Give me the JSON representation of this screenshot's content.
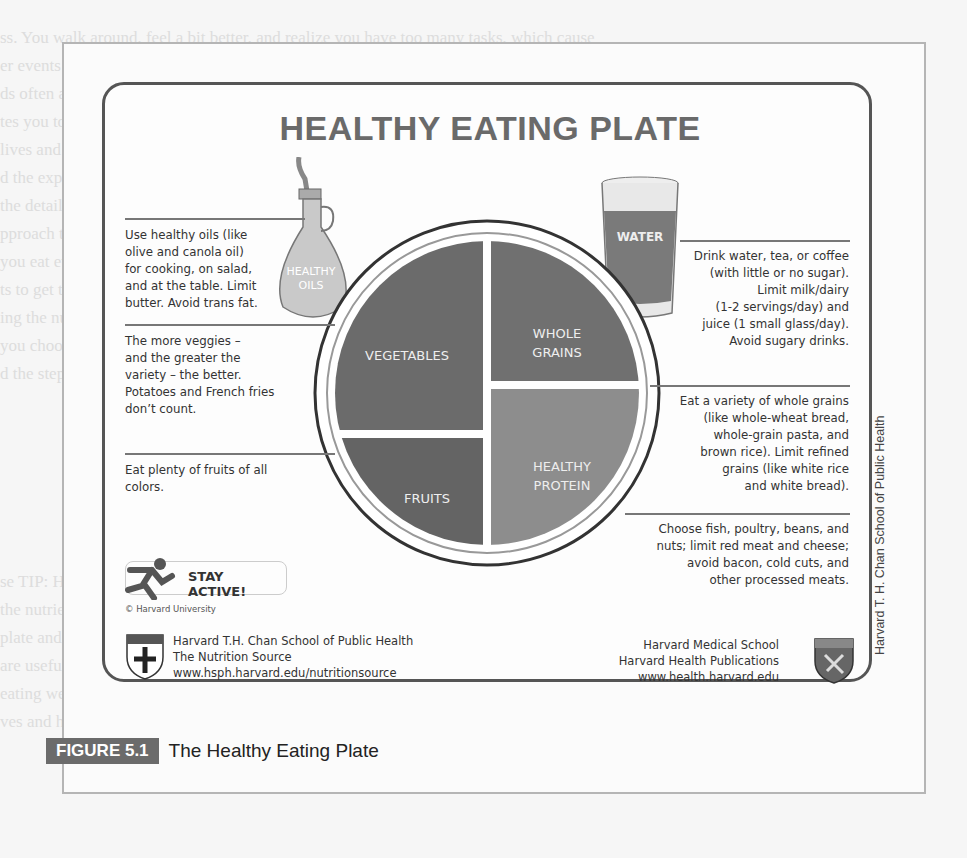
{
  "background_text": {
    "lines": [
      "ss. You walk around, feel a bit better, and realize you have too many tasks, which cause",
      "er events and potentially you're feeling stressed right now.",
      "ds often as you handle the stresses you encounter. The balance is what stress requires, so sh",
      "tes you to do in the first year. Remember, most of us are learning and testing ideas about",
      "lives and that the tasks help us to do what matters. The goal is a balance and reflection",
      "d the experience of an active connection, each of us finds ways of stepping outside,",
      "the details tell us more about how we interpret what we do, and how to take care of what",
      "",
      "pproach to health and wellness in college can cover many things, including your eating a",
      "you eat every day, when you eat, and how much you eat, as well as your other choices",
      "ts to get the energy you need. Over time, your diet choices matter and have consequences.",
      "ing the nutrients that your body requires to keep you feeling healthy, alert, and energetic",
      "you choose the food you eat and the drinks you consume throughout the day for",
      "d the steps along the way and your choices to support your body for learning.",
      "",
      "",
      "",
      "",
      "",
      "",
      "",
      "",
      "se TIP: Harvard School of Public Health and its nutrition guidance give an overview of",
      "the nutrients of food and how to plan meals and snacks to get the right nutrients for the",
      "plate and the healthy eating plate guide to shifting your eating habits in a healthy way",
      "are useful. Each type of food, from vegetables to protein, has a role in health and energy",
      "eating well isn't about strict rules; rather, it's about choosing whole foods, including fruits",
      "ves and healthy fats, planning meals, and taking time to enjoy the food you eat every day"
    ]
  },
  "figure": {
    "title": "HEALTHY EATING PLATE",
    "bottle_label_line1": "HEALTHY",
    "bottle_label_line2": "OILS",
    "glass_label": "WATER",
    "plate": {
      "sections": [
        {
          "name": "VEGETABLES",
          "color": "#6b6b6b"
        },
        {
          "name_line1": "WHOLE",
          "name_line2": "GRAINS",
          "color": "#707070"
        },
        {
          "name": "FRUITS",
          "color": "#646464"
        },
        {
          "name_line1": "HEALTHY",
          "name_line2": "PROTEIN",
          "color": "#8d8d8d"
        }
      ]
    },
    "notes": {
      "oils": [
        "Use healthy oils (like",
        "olive and canola oil)",
        "for cooking, on salad,",
        "and at the table. Limit",
        "butter. Avoid trans fat."
      ],
      "veggies": [
        "The more veggies –",
        "and the greater the",
        "variety – the better.",
        "Potatoes and French fries",
        "don’t count."
      ],
      "fruits": [
        "Eat plenty of fruits of all",
        "colors."
      ],
      "water": [
        "Drink water, tea, or coffee",
        "(with little or no sugar).",
        "Limit milk/dairy",
        "(1-2 servings/day) and",
        "juice (1 small glass/day).",
        "Avoid sugary drinks."
      ],
      "grains": [
        "Eat a variety of whole grains",
        "(like whole-wheat bread,",
        "whole-grain pasta, and",
        "brown rice). Limit refined",
        "grains (like white rice",
        "and white bread)."
      ],
      "protein": [
        "Choose fish, poultry, beans, and",
        "nuts;  limit red meat and cheese;",
        "avoid bacon, cold cuts,  and",
        "other processed meats."
      ]
    },
    "stay_active": "STAY ACTIVE!",
    "copyright": "© Harvard University",
    "footer_left": [
      "Harvard T.H. Chan School of Public Health",
      "The Nutrition Source",
      "www.hsph.harvard.edu/nutritionsource"
    ],
    "footer_right": [
      "Harvard Medical School",
      "Harvard Health Publications",
      "www.health.harvard.edu"
    ],
    "vertical_credit": "Harvard T. H. Chan School of Public Health"
  },
  "caption": {
    "label": "FIGURE 5.1",
    "text": "The Healthy Eating Plate"
  }
}
